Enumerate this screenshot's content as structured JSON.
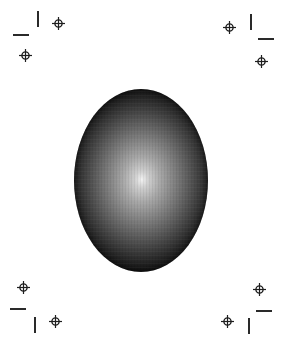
{
  "page": {
    "width": 284,
    "height": 344,
    "background": "#ffffff",
    "ink_color": "#2a2a2a"
  },
  "oval": {
    "shape": "ellipse",
    "left": 74,
    "top": 89,
    "width": 134,
    "height": 183,
    "highlight_center": [
      141,
      180
    ],
    "fill": "radial-gradient",
    "colors": {
      "highlight": "#f2f2f2",
      "mid": "#7f7f7f",
      "edge": "#050505"
    }
  },
  "corners": {
    "top_left": {
      "crop_h": {
        "x": 13,
        "y": 34,
        "length": 16
      },
      "crop_v": {
        "x": 37,
        "y": 11,
        "length": 16
      },
      "targets": [
        [
          58,
          23
        ],
        [
          25,
          55
        ]
      ]
    },
    "top_right": {
      "crop_h": {
        "x": 258,
        "y": 38,
        "length": 16
      },
      "crop_v": {
        "x": 250,
        "y": 14,
        "length": 16
      },
      "targets": [
        [
          229,
          27
        ],
        [
          261,
          61
        ]
      ]
    },
    "bottom_left": {
      "crop_h": {
        "x": 10,
        "y": 308,
        "length": 16
      },
      "crop_v": {
        "x": 34,
        "y": 317,
        "length": 16
      },
      "targets": [
        [
          23,
          287
        ],
        [
          55,
          321
        ]
      ]
    },
    "bottom_right": {
      "crop_h": {
        "x": 256,
        "y": 310,
        "length": 16
      },
      "crop_v": {
        "x": 248,
        "y": 318,
        "length": 16
      },
      "targets": [
        [
          259,
          289
        ],
        [
          227,
          321
        ]
      ]
    }
  },
  "icons": {
    "registration_target": "circle-with-crosshair",
    "crop_mark": "line-segment"
  }
}
